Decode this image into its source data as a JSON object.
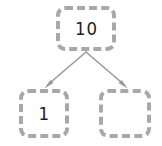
{
  "diagram": {
    "type": "binary-tree",
    "background_color": "#ffffff",
    "node_border_color": "#a8a8a8",
    "node_fill_color": "#ffffff",
    "edge_color": "#9a9a9a",
    "text_color": "#202020",
    "nodes": [
      {
        "id": "root",
        "label": "10",
        "role": "parent-node"
      },
      {
        "id": "left",
        "label": "1",
        "role": "left-child-node"
      },
      {
        "id": "right",
        "label": "",
        "role": "right-child-node"
      }
    ],
    "edges": [
      {
        "from": "root",
        "to": "left",
        "arrow": true
      },
      {
        "from": "root",
        "to": "right",
        "arrow": true
      }
    ]
  }
}
